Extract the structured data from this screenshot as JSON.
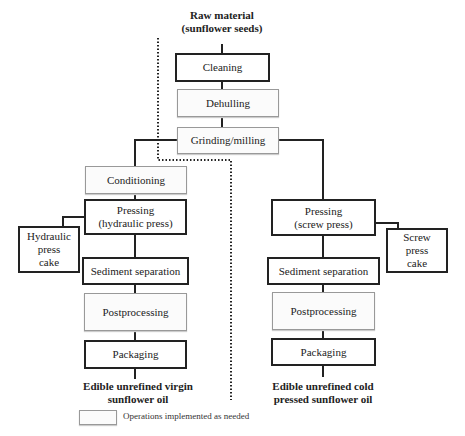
{
  "start": {
    "line1": "Raw material",
    "line2": "(sunflower seeds)"
  },
  "common_steps": [
    {
      "label": "Cleaning",
      "style": "required"
    },
    {
      "label": "Dehulling",
      "style": "optional"
    },
    {
      "label": "Grinding/milling",
      "style": "optional"
    }
  ],
  "left_branch": {
    "steps": [
      {
        "label": "Conditioning",
        "style": "optional"
      },
      {
        "line1": "Pressing",
        "line2": "(hydraulic press)",
        "style": "required"
      },
      {
        "label": "Sediment separation",
        "style": "required"
      },
      {
        "label": "Postprocessing",
        "style": "optional"
      },
      {
        "label": "Packaging",
        "style": "required"
      }
    ],
    "byproduct": {
      "line1": "Hydraulic",
      "line2": "press",
      "line3": "cake"
    },
    "output": {
      "line1": "Edible unrefined virgin",
      "line2": "sunflower oil"
    }
  },
  "right_branch": {
    "steps": [
      {
        "line1": "Pressing",
        "line2": "(screw press)",
        "style": "required"
      },
      {
        "label": "Sediment separation",
        "style": "required"
      },
      {
        "label": "Postprocessing",
        "style": "optional"
      },
      {
        "label": "Packaging",
        "style": "required"
      }
    ],
    "byproduct": {
      "line1": "Screw",
      "line2": "press",
      "line3": "cake"
    },
    "output": {
      "line1": "Edible unrefined cold",
      "line2": "pressed sunflower oil"
    }
  },
  "legend": {
    "label": "Operations implemented as needed"
  }
}
